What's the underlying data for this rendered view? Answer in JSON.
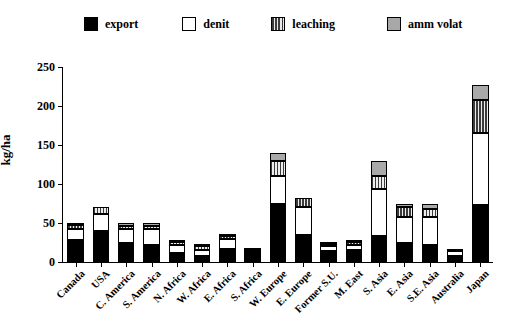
{
  "chart_data": {
    "type": "bar",
    "stacked": true,
    "title": "",
    "xlabel": "",
    "ylabel": "kg/ha",
    "ylim": [
      0,
      250
    ],
    "yticks": [
      0,
      50,
      100,
      150,
      200,
      250
    ],
    "grid": false,
    "legend_position": "top",
    "categories": [
      "Canada",
      "USA",
      "C. America",
      "S. America",
      "N. Africa",
      "W. Africa",
      "E. Africa",
      "S. Africa",
      "W. Europe",
      "E. Europe",
      "Former S.U.",
      "M. East",
      "S. Asia",
      "E. Asia",
      "S.E. Asia",
      "Australia",
      "Japan"
    ],
    "series": [
      {
        "name": "export",
        "color": "#000000",
        "values": [
          28,
          40,
          25,
          22,
          12,
          8,
          17,
          13,
          75,
          35,
          14,
          16,
          33,
          25,
          22,
          8,
          73
        ]
      },
      {
        "name": "denit",
        "color": "#ffffff",
        "values": [
          14,
          22,
          17,
          20,
          10,
          8,
          13,
          1,
          35,
          35,
          6,
          6,
          60,
          33,
          36,
          6,
          92
        ]
      },
      {
        "name": "leaching",
        "color": "#3b3b3b",
        "values": [
          6,
          8,
          4,
          4,
          4,
          4,
          4,
          1,
          20,
          12,
          3,
          4,
          17,
          12,
          10,
          1,
          43
        ]
      },
      {
        "name": "amm volat",
        "color": "#a9a9a9",
        "values": [
          2,
          0,
          4,
          4,
          2,
          1,
          1,
          0,
          10,
          0,
          1,
          2,
          20,
          5,
          7,
          0,
          19
        ]
      }
    ],
    "totals": [
      50,
      70,
      50,
      50,
      28,
      21,
      35,
      15,
      140,
      82,
      24,
      28,
      130,
      75,
      75,
      15,
      227
    ]
  },
  "legend": {
    "items": [
      {
        "label": "export",
        "swatch": "swatch-export-icon"
      },
      {
        "label": "denit",
        "swatch": "swatch-denit-icon"
      },
      {
        "label": "leaching",
        "swatch": "swatch-leaching-icon"
      },
      {
        "label": "amm volat",
        "swatch": "swatch-amm-volat-icon"
      }
    ]
  }
}
